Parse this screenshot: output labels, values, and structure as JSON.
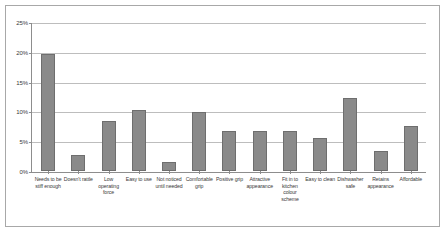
{
  "chart_data": {
    "type": "bar",
    "title": "",
    "xlabel": "",
    "ylabel": "",
    "ylim": [
      0,
      25
    ],
    "ytick_labels": [
      "0%",
      "5%",
      "10%",
      "15%",
      "20%",
      "25%"
    ],
    "ytick_values": [
      0,
      5,
      10,
      15,
      20,
      25
    ],
    "grid": true,
    "legend": "none",
    "value_unit": "%",
    "categories": [
      "Needs to be stiff enough",
      "Doesn't rattle",
      "Low operating force",
      "Easy to use",
      "Not noticed until needed",
      "Comfortable grip",
      "Positive grip",
      "Attractive appearance",
      "Fit in to kitchen colour scheme",
      "Easy to clean",
      "Dishwasher safe",
      "Retains appearance",
      "Affordable"
    ],
    "values": [
      19.8,
      2.7,
      8.4,
      10.3,
      1.6,
      10.0,
      6.8,
      6.7,
      6.8,
      5.5,
      12.3,
      3.4,
      7.6
    ]
  },
  "style": {
    "bar_fill": "#8a8a8a",
    "bar_stroke": "#6e6e6e",
    "gridline_color": "#bdbdbd",
    "axis_color": "#8d8d8d",
    "frame_color": "#a8a8a8",
    "background": "#ffffff",
    "text_color": "#3a3a3a"
  }
}
